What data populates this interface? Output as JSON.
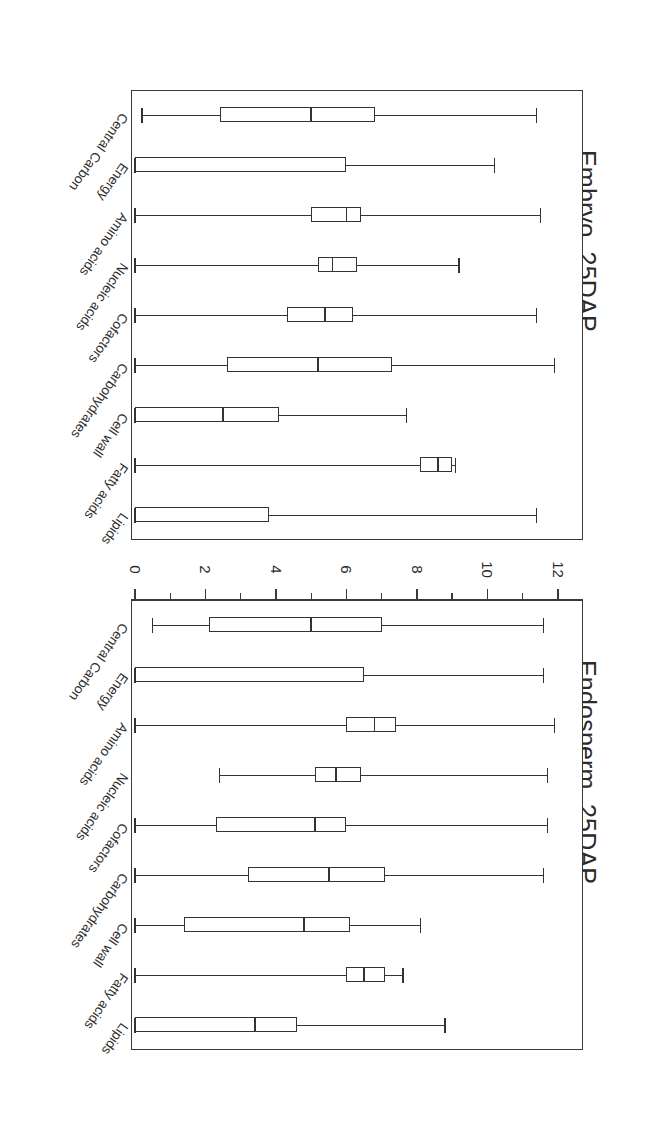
{
  "figure": {
    "axis_title": "Reaction Expression Score",
    "tick_labels": [
      "0",
      "2",
      "4",
      "6",
      "8",
      "10",
      "12"
    ],
    "categories": [
      "Central Carbon",
      "Energy",
      "Amino acids",
      "Nucleic acids",
      "Cofactors",
      "Carbohydrates",
      "Cell wall",
      "Fatty acids",
      "Lipids"
    ],
    "panels": [
      {
        "title": "Endosperm, 25DAP"
      },
      {
        "title": "Embryo, 25DAP"
      }
    ]
  },
  "chart_data": [
    {
      "type": "box",
      "title": "Endosperm, 25DAP",
      "xlabel": "Reaction Expression Score",
      "ylabel": "",
      "orientation": "horizontal",
      "xlim": [
        0,
        12.6
      ],
      "ticks": [
        0,
        2,
        4,
        6,
        8,
        10,
        12
      ],
      "minor_ticks": [
        1,
        3,
        5,
        7,
        9,
        11
      ],
      "grid": false,
      "legend": "none",
      "categories": [
        "Central Carbon",
        "Energy",
        "Amino acids",
        "Nucleic acids",
        "Cofactors",
        "Carbohydrates",
        "Cell wall",
        "Fatty acids",
        "Lipids"
      ],
      "boxes": [
        {
          "category": "Central Carbon",
          "whisker_low": 0.5,
          "q1": 2.1,
          "median": 5.0,
          "q3": 7.0,
          "whisker_high": 11.6
        },
        {
          "category": "Energy",
          "whisker_low": 0.0,
          "q1": 0.0,
          "median": 0.0,
          "q3": 6.5,
          "whisker_high": 11.6
        },
        {
          "category": "Amino acids",
          "whisker_low": 0.0,
          "q1": 6.0,
          "median": 6.8,
          "q3": 7.4,
          "whisker_high": 11.9
        },
        {
          "category": "Nucleic acids",
          "whisker_low": 2.4,
          "q1": 5.1,
          "median": 5.7,
          "q3": 6.4,
          "whisker_high": 11.7
        },
        {
          "category": "Cofactors",
          "whisker_low": 0.0,
          "q1": 2.3,
          "median": 5.1,
          "q3": 6.0,
          "whisker_high": 11.7
        },
        {
          "category": "Carbohydrates",
          "whisker_low": 0.0,
          "q1": 3.2,
          "median": 5.5,
          "q3": 7.1,
          "whisker_high": 11.6
        },
        {
          "category": "Cell wall",
          "whisker_low": 0.0,
          "q1": 1.4,
          "median": 4.8,
          "q3": 6.1,
          "whisker_high": 8.1
        },
        {
          "category": "Fatty acids",
          "whisker_low": 0.0,
          "q1": 6.0,
          "median": 6.5,
          "q3": 7.1,
          "whisker_high": 7.6
        },
        {
          "category": "Lipids",
          "whisker_low": 0.0,
          "q1": 0.0,
          "median": 3.4,
          "q3": 4.6,
          "whisker_high": 8.8
        }
      ]
    },
    {
      "type": "box",
      "title": "Embryo, 25DAP",
      "xlabel": "Reaction Expression Score",
      "ylabel": "",
      "orientation": "horizontal",
      "xlim": [
        0,
        12.6
      ],
      "ticks": [
        0,
        2,
        4,
        6,
        8,
        10,
        12
      ],
      "minor_ticks": [
        1,
        3,
        5,
        7,
        9,
        11
      ],
      "grid": false,
      "legend": "none",
      "categories": [
        "Central Carbon",
        "Energy",
        "Amino acids",
        "Nucleic acids",
        "Cofactors",
        "Carbohydrates",
        "Cell wall",
        "Fatty acids",
        "Lipids"
      ],
      "boxes": [
        {
          "category": "Central Carbon",
          "whisker_low": 0.2,
          "q1": 2.4,
          "median": 5.0,
          "q3": 6.8,
          "whisker_high": 11.4
        },
        {
          "category": "Energy",
          "whisker_low": 0.0,
          "q1": 0.0,
          "median": 0.0,
          "q3": 6.0,
          "whisker_high": 10.2
        },
        {
          "category": "Amino acids",
          "whisker_low": 0.0,
          "q1": 5.0,
          "median": 6.0,
          "q3": 6.4,
          "whisker_high": 11.5
        },
        {
          "category": "Nucleic acids",
          "whisker_low": 0.0,
          "q1": 5.2,
          "median": 5.6,
          "q3": 6.3,
          "whisker_high": 9.2
        },
        {
          "category": "Cofactors",
          "whisker_low": 0.0,
          "q1": 4.3,
          "median": 5.4,
          "q3": 6.2,
          "whisker_high": 11.4
        },
        {
          "category": "Carbohydrates",
          "whisker_low": 0.0,
          "q1": 2.6,
          "median": 5.2,
          "q3": 7.3,
          "whisker_high": 11.9
        },
        {
          "category": "Cell wall",
          "whisker_low": 0.0,
          "q1": 0.0,
          "median": 2.5,
          "q3": 4.1,
          "whisker_high": 7.7
        },
        {
          "category": "Fatty acids",
          "whisker_low": 0.0,
          "q1": 8.1,
          "median": 8.6,
          "q3": 9.0,
          "whisker_high": 9.1
        },
        {
          "category": "Lipids",
          "whisker_low": 0.0,
          "q1": 0.0,
          "median": 0.0,
          "q3": 3.8,
          "whisker_high": 11.4
        }
      ]
    }
  ]
}
